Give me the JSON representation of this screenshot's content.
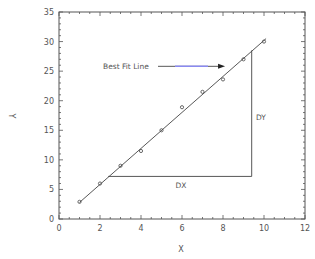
{
  "chart_data": {
    "type": "scatter",
    "title": "",
    "xlabel": "X",
    "ylabel": "Y",
    "xlim": [
      0,
      12
    ],
    "ylim": [
      0,
      35
    ],
    "xticks": [
      0,
      2,
      4,
      6,
      8,
      10,
      12
    ],
    "yticks": [
      0,
      5,
      10,
      15,
      20,
      25,
      30,
      35
    ],
    "grid": false,
    "legend": null,
    "series": [
      {
        "name": "data points",
        "marker": "open-circle",
        "x": [
          1,
          2,
          3,
          4,
          5,
          6,
          7,
          8,
          9,
          10
        ],
        "y": [
          2.9,
          6.0,
          9.0,
          11.5,
          15.0,
          18.9,
          21.5,
          23.6,
          27.0,
          30.0
        ]
      },
      {
        "name": "Best Fit Line",
        "style": "line",
        "x": [
          1,
          10.1
        ],
        "y": [
          2.8,
          30.5
        ]
      }
    ],
    "annotations": [
      {
        "text": "Best Fit Line",
        "x": 2.1,
        "y": 26.0,
        "arrow_to": [
          8.1,
          25.9
        ]
      },
      {
        "text": "DX",
        "x": 5.8,
        "y": 5.7,
        "segment": {
          "from": [
            2.4,
            7.2
          ],
          "to": [
            9.4,
            7.2
          ]
        }
      },
      {
        "text": "DY",
        "x": 9.6,
        "y": 17.0,
        "segment": {
          "from": [
            9.4,
            7.2
          ],
          "to": [
            9.4,
            28.5
          ]
        }
      }
    ]
  },
  "labels": {
    "xlabel": "X",
    "ylabel": "Y",
    "best_fit": "Best Fit Line",
    "dx": "DX",
    "dy": "DY"
  },
  "colors": {
    "axis": "#555555",
    "line": "#444444",
    "arrow_accent": "#8a8af0",
    "text": "#555555"
  }
}
